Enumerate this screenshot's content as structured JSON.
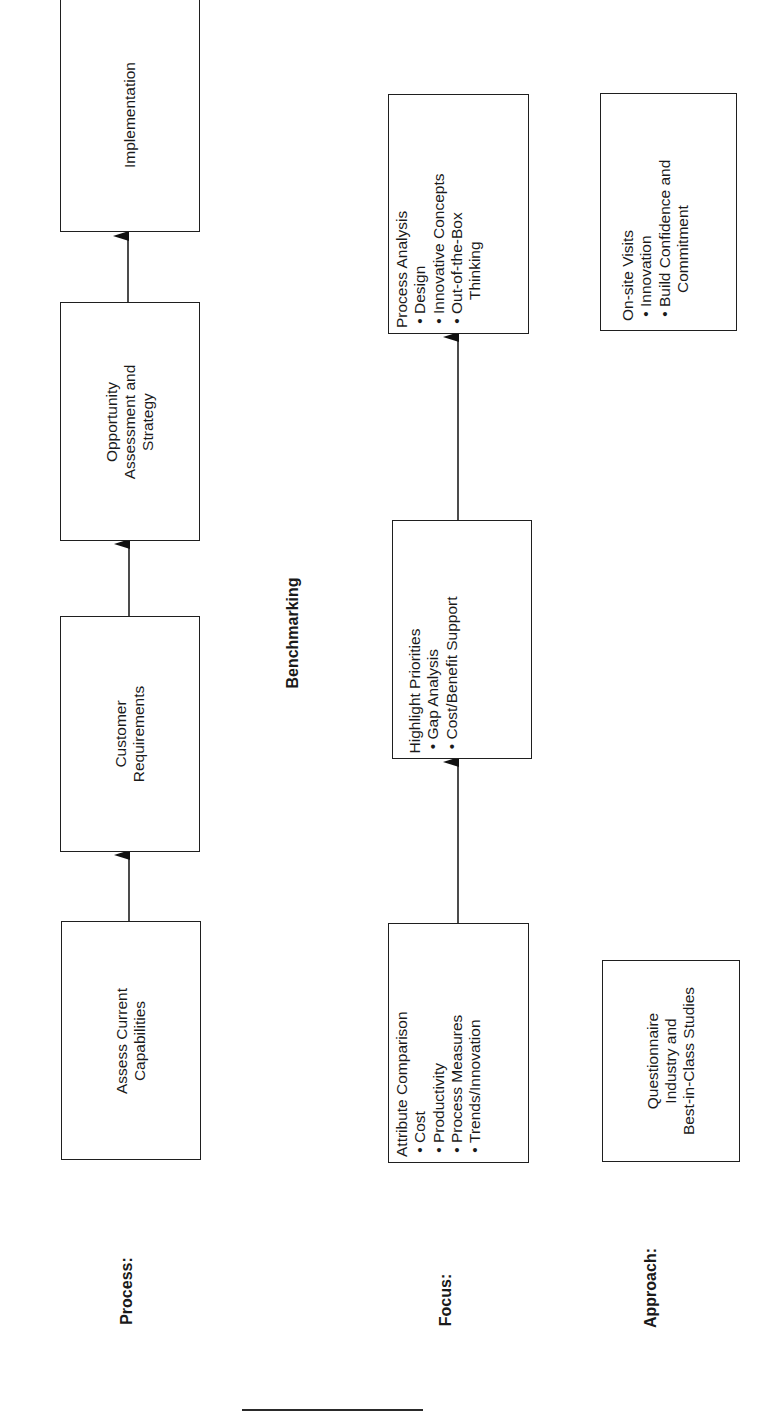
{
  "diagram": {
    "title": "Benchmarking",
    "orientation": "rotated-90-ccw",
    "rows": {
      "process": {
        "label": "Process:",
        "boxes": [
          {
            "lines": [
              "Assess Current",
              "Capabilities"
            ]
          },
          {
            "lines": [
              "Customer",
              "Requirements"
            ]
          },
          {
            "lines": [
              "Opportunity",
              "Assessment and",
              "Strategy"
            ]
          },
          {
            "lines": [
              "Implementation"
            ]
          }
        ]
      },
      "focus": {
        "label": "Focus:",
        "boxes": [
          {
            "heading": "Attribute Comparison",
            "bullets": [
              {
                "text": "Cost"
              },
              {
                "text": "Productivity"
              },
              {
                "text": "Process Measures"
              },
              {
                "text": "Trends/Innovation"
              }
            ]
          },
          {
            "heading": "Highlight Priorities",
            "bullets": [
              {
                "text": "Gap Analysis"
              },
              {
                "text": "Cost/Benefit Support"
              }
            ]
          },
          {
            "heading": "Process Analysis",
            "bullets": [
              {
                "text": "Design"
              },
              {
                "text": "Innovative Concepts"
              },
              {
                "text": "Out-of-the-Box",
                "cont": "Thinking"
              }
            ]
          }
        ]
      },
      "approach": {
        "label": "Approach:",
        "boxes": [
          {
            "lines": [
              "Questionnaire",
              "Industry and",
              "Best-in-Class Studies"
            ]
          },
          {
            "heading": "On-site Visits",
            "bullets": [
              {
                "text": "Innovation"
              },
              {
                "text": "Build Confidence and",
                "cont": "Commitment"
              }
            ]
          }
        ]
      }
    },
    "bullet_glyph": "•",
    "colors": {
      "stroke": "#1f1f1f",
      "text": "#1a1a1a",
      "background": "#ffffff"
    }
  }
}
